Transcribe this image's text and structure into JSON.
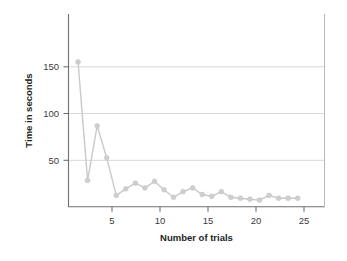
{
  "chart_data": {
    "type": "line",
    "title": "",
    "xlabel": "Number of trials",
    "ylabel": "Time in seconds",
    "x": [
      1,
      2,
      3,
      4,
      5,
      6,
      7,
      8,
      9,
      10,
      11,
      12,
      13,
      14,
      15,
      16,
      17,
      18,
      19,
      20,
      21,
      22,
      23,
      24
    ],
    "values": [
      154,
      28,
      86,
      52,
      12,
      19,
      25,
      20,
      27,
      18,
      10,
      16,
      20,
      13,
      11,
      16,
      10,
      9,
      8,
      7,
      12,
      9,
      9,
      9
    ],
    "series": [
      {
        "name": "Time in seconds",
        "values": [
          154,
          28,
          86,
          52,
          12,
          19,
          25,
          20,
          27,
          18,
          10,
          16,
          20,
          13,
          11,
          16,
          10,
          9,
          8,
          7,
          12,
          9,
          9,
          9
        ]
      }
    ],
    "xlim": [
      0,
      26.8
    ],
    "ylim": [
      0,
      205
    ],
    "xticks": [
      5,
      10,
      15,
      20,
      25
    ],
    "yticks": [
      50,
      100,
      150
    ],
    "xtick_labels": [
      "5",
      "10",
      "15",
      "20",
      "25"
    ],
    "ytick_labels": [
      "50",
      "100",
      "150"
    ],
    "grid": "horizontal",
    "legend": "none",
    "marker": "circle",
    "colors": {
      "line": "#c9c9c9",
      "marker": "#cfcfcf",
      "gridline": "#d9d9d9",
      "axis": "#6f6f6f",
      "text": "#231f20",
      "background": "#ffffff"
    }
  }
}
